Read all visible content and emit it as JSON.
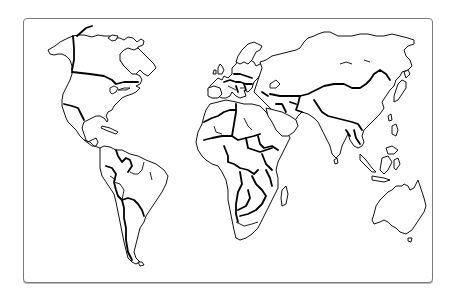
{
  "figure": {
    "type": "outline-map",
    "labels_visible": false
  },
  "frame": {
    "border_color": "#7a7a7a",
    "background": "#ffffff"
  },
  "style": {
    "coastline_color": "#111111",
    "border_color": "#000000",
    "land_fill": "#ffffff"
  },
  "regions": [
    {
      "id": "north-america",
      "name": "North America"
    },
    {
      "id": "greenland",
      "name": "Greenland"
    },
    {
      "id": "south-america",
      "name": "South America"
    },
    {
      "id": "europe",
      "name": "Europe"
    },
    {
      "id": "africa",
      "name": "Africa"
    },
    {
      "id": "asia",
      "name": "Asia"
    },
    {
      "id": "australia",
      "name": "Australia"
    }
  ]
}
